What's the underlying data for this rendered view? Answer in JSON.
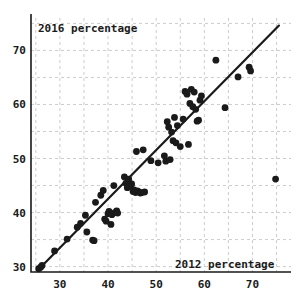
{
  "chart_data": {
    "type": "scatter",
    "title": "",
    "xlabel": "2012 percentage",
    "ylabel": "2016 percentage",
    "xlim": [
      24,
      78
    ],
    "ylim": [
      29,
      76
    ],
    "grid": true,
    "legend_position": "none",
    "xticks": [
      30,
      40,
      50,
      60,
      70
    ],
    "yticks": [
      30,
      40,
      50,
      60,
      70
    ],
    "xtick_labels": [
      "30",
      "40",
      "50",
      "60",
      "70"
    ],
    "ytick_labels": [
      "30",
      "40",
      "50",
      "60",
      "70"
    ],
    "minor_grid_step": 5,
    "point_color": "#1a1a1a",
    "grid_color": "#cccccc",
    "line_color": "#1a1a1a",
    "trendline": {
      "type": "linear-fit",
      "x_start": 25.5,
      "y_start": 29.4,
      "x_end": 75.5,
      "y_end": 74.6
    },
    "series": [
      {
        "name": "counties",
        "points": [
          [
            25.6,
            29.6
          ],
          [
            26.0,
            29.9
          ],
          [
            26.3,
            30.2
          ],
          [
            28.9,
            32.9
          ],
          [
            31.5,
            35.1
          ],
          [
            33.6,
            37.3
          ],
          [
            34.3,
            38.0
          ],
          [
            35.3,
            39.5
          ],
          [
            35.6,
            36.4
          ],
          [
            36.8,
            34.9
          ],
          [
            37.1,
            34.8
          ],
          [
            37.4,
            41.9
          ],
          [
            38.5,
            43.2
          ],
          [
            39.0,
            44.1
          ],
          [
            39.3,
            38.8
          ],
          [
            39.6,
            38.4
          ],
          [
            40.0,
            39.8
          ],
          [
            40.2,
            40.2
          ],
          [
            40.6,
            37.8
          ],
          [
            40.8,
            39.6
          ],
          [
            41.2,
            45.0
          ],
          [
            41.4,
            40.0
          ],
          [
            41.8,
            40.3
          ],
          [
            42.0,
            39.9
          ],
          [
            43.4,
            46.6
          ],
          [
            43.7,
            45.4
          ],
          [
            44.0,
            44.6
          ],
          [
            44.3,
            46.2
          ],
          [
            44.6,
            44.9
          ],
          [
            44.9,
            45.3
          ],
          [
            45.2,
            43.9
          ],
          [
            45.4,
            44.2
          ],
          [
            45.7,
            43.7
          ],
          [
            45.9,
            51.3
          ],
          [
            46.1,
            44.0
          ],
          [
            46.4,
            43.8
          ],
          [
            46.7,
            43.6
          ],
          [
            47.0,
            43.7
          ],
          [
            47.3,
            51.6
          ],
          [
            47.6,
            43.8
          ],
          [
            48.9,
            49.6
          ],
          [
            50.4,
            49.2
          ],
          [
            51.7,
            50.5
          ],
          [
            52.0,
            49.5
          ],
          [
            52.3,
            56.8
          ],
          [
            52.6,
            55.8
          ],
          [
            52.9,
            49.8
          ],
          [
            53.2,
            54.9
          ],
          [
            53.5,
            53.3
          ],
          [
            53.8,
            57.6
          ],
          [
            54.1,
            52.9
          ],
          [
            54.4,
            56.1
          ],
          [
            55.0,
            52.2
          ],
          [
            55.6,
            57.3
          ],
          [
            56.0,
            62.4
          ],
          [
            56.4,
            61.9
          ],
          [
            56.7,
            52.6
          ],
          [
            57.0,
            60.2
          ],
          [
            57.3,
            62.8
          ],
          [
            57.6,
            59.6
          ],
          [
            57.9,
            62.3
          ],
          [
            58.2,
            59.1
          ],
          [
            58.5,
            56.9
          ],
          [
            58.8,
            57.1
          ],
          [
            59.1,
            60.8
          ],
          [
            59.4,
            61.6
          ],
          [
            62.4,
            68.2
          ],
          [
            64.3,
            59.4
          ],
          [
            67.0,
            65.1
          ],
          [
            69.3,
            66.9
          ],
          [
            69.6,
            66.2
          ],
          [
            74.8,
            46.2
          ]
        ]
      }
    ]
  },
  "axes": {
    "y_axis_label": "2016 percentage",
    "x_axis_label": "2012 percentage"
  }
}
